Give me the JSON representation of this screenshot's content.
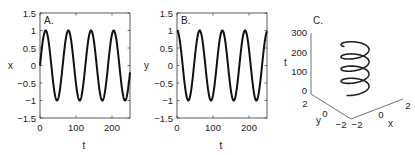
{
  "chart_data": [
    {
      "type": "line",
      "panel_label": "A.",
      "xlabel": "t",
      "ylabel": "x",
      "xlim": [
        0,
        250
      ],
      "ylim": [
        -1.5,
        1.5
      ],
      "xticks": [
        "0",
        "100",
        "200"
      ],
      "yticks": [
        "1.5",
        "1",
        "0.5",
        "0",
        "-0.5",
        "-1",
        "-1.5"
      ],
      "grid": false,
      "series": [
        {
          "name": "x(t)",
          "function": "sin(2*pi*t/63)",
          "amplitude": 1,
          "period": 63,
          "phase": "sine"
        }
      ]
    },
    {
      "type": "line",
      "panel_label": "B.",
      "xlabel": "t",
      "ylabel": "y",
      "xlim": [
        0,
        250
      ],
      "ylim": [
        -1.5,
        1.5
      ],
      "xticks": [
        "0",
        "100",
        "200"
      ],
      "yticks": [
        "1.5",
        "1",
        "0.5",
        "0",
        "-0.5",
        "-1",
        "-1.5"
      ],
      "grid": false,
      "series": [
        {
          "name": "y(t)",
          "function": "cos(2*pi*t/63)",
          "amplitude": 1,
          "period": 63,
          "phase": "cosine"
        }
      ]
    },
    {
      "type": "line3d",
      "panel_label": "C.",
      "xlabel": "x",
      "ylabel": "y",
      "zlabel": "t",
      "xticks": [
        "-2",
        "0",
        "2"
      ],
      "yticks": [
        "-2",
        "0",
        "2"
      ],
      "zticks": [
        "0",
        "100",
        "200",
        "300"
      ],
      "xlim": [
        -2,
        2
      ],
      "ylim": [
        -2,
        2
      ],
      "zlim": [
        0,
        300
      ],
      "series": [
        {
          "name": "helix",
          "x": "sin(2*pi*t/63)",
          "y": "cos(2*pi*t/63)",
          "z": "t",
          "t_range": [
            0,
            250
          ]
        }
      ]
    }
  ],
  "panels": {
    "a": {
      "label": "A.",
      "xlabel": "t",
      "ylabel": "x",
      "yticks": [
        "1.5",
        "1",
        "0.5",
        "0",
        "−0.5",
        "−1",
        "−1.5"
      ],
      "xticks": [
        "0",
        "100",
        "200"
      ]
    },
    "b": {
      "label": "B.",
      "xlabel": "t",
      "ylabel": "y",
      "yticks": [
        "1.5",
        "1",
        "0.5",
        "0",
        "−0.5",
        "−1",
        "−1.5"
      ],
      "xticks": [
        "0",
        "100",
        "200"
      ]
    },
    "c": {
      "label": "C.",
      "zlabel": "t",
      "ylabel": "y",
      "xlabel": "x",
      "zticks": [
        "300",
        "200",
        "100",
        "0"
      ],
      "yticks": [
        "2",
        "0",
        "−2"
      ],
      "xticks": [
        "−2",
        "0",
        "2"
      ]
    }
  }
}
